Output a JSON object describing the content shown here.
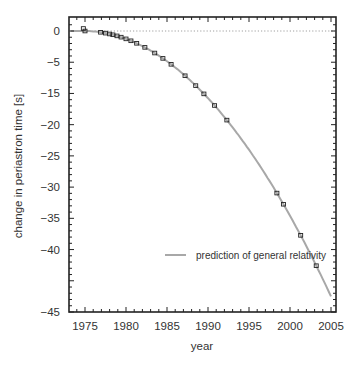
{
  "chart_data": {
    "type": "scatter",
    "title": "",
    "xlabel": "year",
    "ylabel": "change in periastron time [s]",
    "xlim": [
      1973,
      2005.5
    ],
    "ylim": [
      -45,
      2
    ],
    "x_ticks": [
      1975,
      1980,
      1985,
      1990,
      1995,
      2000,
      2005
    ],
    "x_tick_labels": [
      "1975",
      "1980",
      "1985",
      "1990",
      "1995",
      "2000",
      "2005"
    ],
    "y_ticks": [
      0,
      -5,
      -10,
      -15,
      -20,
      -25,
      -30,
      -35,
      -40,
      -45
    ],
    "y_tick_labels": [
      "0",
      "−5",
      "−15",
      "−20",
      "−25",
      "−30",
      "−35",
      "−40",
      "−45"
    ],
    "y_tick_label_positions": [
      0,
      -5,
      -10,
      -15,
      -20,
      -25,
      -30,
      -35,
      -40,
      -45
    ],
    "zero_reference_line": {
      "y": 0,
      "style": "dotted",
      "color": "#888888"
    },
    "grid": false,
    "legend": {
      "position": "lower-left-center",
      "entries": [
        {
          "label": "prediction of general relativity",
          "color": "#a8a8a8",
          "style": "line"
        }
      ]
    },
    "series": [
      {
        "name": "prediction of general relativity",
        "kind": "curve",
        "color": "#a8a8a8",
        "x": [
          1974.8,
          1977,
          1979,
          1981,
          1983,
          1985,
          1987,
          1989,
          1991,
          1993,
          1995,
          1997,
          1999,
          2001,
          2003,
          2005
        ],
        "y": [
          0,
          -0.2,
          -0.7,
          -1.4,
          -2.5,
          -3.8,
          -5.5,
          -7.4,
          -9.6,
          -12.1,
          -14.9,
          -18.0,
          -21.4,
          -25.1,
          -29.1,
          -33.4
        ]
      },
      {
        "name": "observed periastron shift",
        "kind": "markers",
        "marker": "open-square",
        "color": "#222222",
        "x": [
          1974.8,
          1975.0,
          1976.9,
          1977.5,
          1978.0,
          1978.4,
          1978.9,
          1979.4,
          1980.0,
          1980.6,
          1981.3,
          1982.3,
          1983.5,
          1984.5,
          1985.5,
          1987.2,
          1988.5,
          1989.5,
          1990.8,
          1992.3,
          1998.4,
          1999.2,
          2001.3,
          2003.2
        ],
        "y": [
          0.2,
          0.0,
          -0.3,
          0.0,
          -0.6,
          -0.6,
          -0.7,
          -0.9,
          -1.3,
          -1.4,
          -1.6,
          -2.0,
          -2.4,
          -3.1,
          -3.6,
          -4.7,
          -5.6,
          -6.1,
          -7.2,
          -8.3,
          -13.8,
          -14.9,
          -17.8,
          -20.5
        ]
      }
    ]
  }
}
